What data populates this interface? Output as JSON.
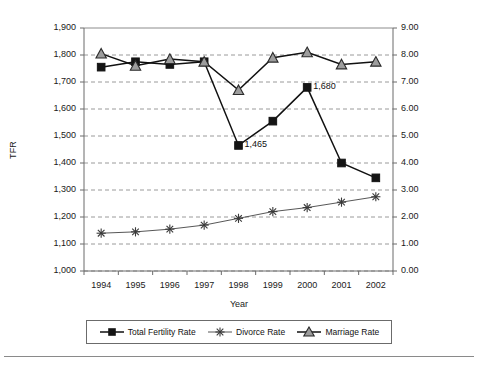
{
  "chart_data": {
    "type": "line",
    "title": "",
    "xlabel": "Year",
    "ylabel": "TFR",
    "ylabel_right": "",
    "categories": [
      "1994",
      "1995",
      "1996",
      "1997",
      "1998",
      "1999",
      "2000",
      "2001",
      "2002"
    ],
    "ylim": [
      1000,
      1900
    ],
    "ylim_right": [
      0.0,
      9.0
    ],
    "ytick_labels": [
      "1,900",
      "1,800",
      "1,700",
      "1,600",
      "1,500",
      "1,400",
      "1,300",
      "1,200",
      "1,100",
      "1,000"
    ],
    "ytick_values": [
      1900,
      1800,
      1700,
      1600,
      1500,
      1400,
      1300,
      1200,
      1100,
      1000
    ],
    "ytick_right_labels": [
      "9.00",
      "8.00",
      "7.00",
      "6.00",
      "5.00",
      "4.00",
      "3.00",
      "2.00",
      "1.00",
      "0.00"
    ],
    "ytick_right_values": [
      9.0,
      8.0,
      7.0,
      6.0,
      5.0,
      4.0,
      3.0,
      2.0,
      1.0,
      0.0
    ],
    "grid": true,
    "grid_style": "dashed-horizontal",
    "legend_position": "bottom",
    "series": [
      {
        "name": "Total Fertility Rate",
        "axis": "left",
        "marker": "square",
        "color": "#111111",
        "values": [
          1755,
          1775,
          1765,
          1775,
          1465,
          1555,
          1680,
          1400,
          1345
        ]
      },
      {
        "name": "Divorce Rate",
        "axis": "right",
        "marker": "asterisk",
        "color": "#444444",
        "values": [
          1.4,
          1.45,
          1.55,
          1.7,
          1.95,
          2.2,
          2.35,
          2.55,
          2.75
        ]
      },
      {
        "name": "Marriage Rate",
        "axis": "right",
        "marker": "triangle",
        "color": "#111111",
        "values": [
          8.05,
          7.6,
          7.85,
          7.75,
          6.7,
          7.9,
          8.1,
          7.65,
          7.75
        ]
      }
    ],
    "annotations": [
      {
        "text": "1,465",
        "series": "Total Fertility Rate",
        "category": "1998"
      },
      {
        "text": "1,680",
        "series": "Total Fertility Rate",
        "category": "2000"
      }
    ]
  }
}
